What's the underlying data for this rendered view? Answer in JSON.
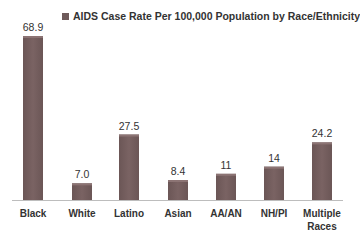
{
  "chart_data": {
    "type": "bar",
    "title": "",
    "legend": [
      "AIDS Case Rate Per 100,000 Population by Race/Ethnicity"
    ],
    "legend_position": "top",
    "categories": [
      "Black",
      "White",
      "Latino",
      "Asian",
      "AA/AN",
      "NH/PI",
      "Multiple Races"
    ],
    "series": [
      {
        "name": "AIDS Case Rate Per 100,000 Population by Race/Ethnicity",
        "values": [
          68.9,
          7.0,
          27.5,
          8.4,
          11,
          14,
          24.2
        ],
        "labels": [
          "68.9",
          "7.0",
          "27.5",
          "8.4",
          "11",
          "14",
          "24.2"
        ]
      }
    ],
    "xlabel": "",
    "ylabel": "",
    "ylim": [
      0,
      70
    ],
    "grid": false,
    "colors": {
      "bar": "#6b5656",
      "bar_top": "#8c7474",
      "axis": "#bdbdbd",
      "text": "#333333"
    }
  }
}
